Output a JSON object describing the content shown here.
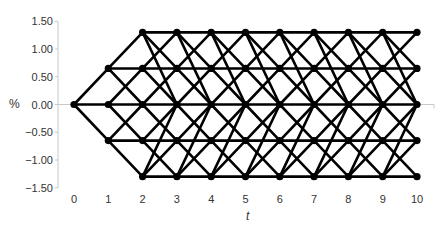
{
  "chart_data": {
    "type": "diagram",
    "title": "",
    "subtitle": "Trinomial interest rate tree (Hull-White style)",
    "xlabel": "t",
    "ylabel": "%",
    "x_ticks": [
      "0",
      "1",
      "2",
      "3",
      "4",
      "5",
      "6",
      "7",
      "8",
      "9",
      "10"
    ],
    "y_ticks": [
      "1.50",
      "1.00",
      "0.50",
      "0.00",
      "−0.50",
      "−1.00",
      "−1.50"
    ],
    "y_tick_values": [
      1.5,
      1.0,
      0.5,
      0.0,
      -0.5,
      -1.0,
      -1.5
    ],
    "ylim": [
      -1.5,
      1.5
    ],
    "xlim": [
      0,
      10
    ],
    "node_levels": [
      1.3,
      0.65,
      0.0,
      -0.65,
      -1.3
    ],
    "j_max": 2,
    "dx": 0.65,
    "steps": 10,
    "branching": {
      "top": "stay, down 1, down 2",
      "interior": "up 1, stay, down 1",
      "bottom": "stay, up 1, up 2"
    },
    "grid": false,
    "colors": {
      "edge": "#000000",
      "node": "#000000",
      "axis": "#c8c8c8",
      "text": "#333333"
    }
  }
}
